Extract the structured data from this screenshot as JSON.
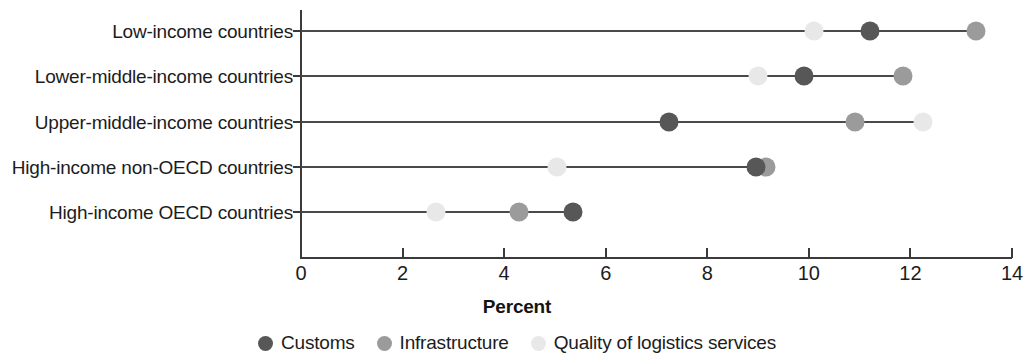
{
  "chart_data": {
    "type": "scatter",
    "title": "",
    "subtitle": "",
    "xlabel": "Percent",
    "ylabel": "",
    "xlim": [
      0,
      14
    ],
    "xticks": [
      0,
      2,
      4,
      6,
      8,
      10,
      12,
      14
    ],
    "xtick_labels": [
      "0",
      "2",
      "4",
      "6",
      "8",
      "10",
      "12",
      "14"
    ],
    "grid": false,
    "legend_position": "bottom-center",
    "orientation": "horizontal",
    "categories": [
      "Low-income countries",
      "Lower-middle-income countries",
      "Upper-middle-income countries",
      "High-income non-OECD countries",
      "High-income OECD countries"
    ],
    "series": [
      {
        "name": "Customs",
        "color": "#575757",
        "values": [
          11.2,
          9.9,
          7.25,
          8.95,
          5.35
        ]
      },
      {
        "name": "Infrastructure",
        "color": "#9b9b9b",
        "values": [
          13.3,
          11.85,
          10.9,
          9.15,
          4.3
        ]
      },
      {
        "name": "Quality of logistics services",
        "color": "#e8e8e8",
        "values": [
          10.1,
          9.0,
          12.25,
          5.05,
          2.65
        ]
      }
    ]
  },
  "axis": {
    "x_title": "Percent"
  },
  "legend": {
    "items": [
      {
        "label": "Customs",
        "color": "#575757"
      },
      {
        "label": "Infrastructure",
        "color": "#9b9b9b"
      },
      {
        "label": "Quality of logistics services",
        "color": "#e8e8e8"
      }
    ]
  },
  "colors": {
    "axis": "#3a3a3a",
    "connector": "#4a4a4a",
    "text": "#1c1c1c",
    "background": "#ffffff"
  }
}
